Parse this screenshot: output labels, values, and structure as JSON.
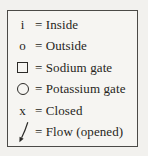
{
  "figure": {
    "type": "legend",
    "background_color": "#f2f1ee",
    "box_background_color": "#f6f5f2",
    "border_color": "#4b4a47",
    "text_color": "#262521"
  },
  "legend": {
    "rows": [
      {
        "symbol": "i",
        "icon": null,
        "label": "= Inside"
      },
      {
        "symbol": "o",
        "icon": null,
        "label": "= Outside"
      },
      {
        "symbol": null,
        "icon": "sodium-gate-square-icon",
        "label": "= Sodium gate"
      },
      {
        "symbol": null,
        "icon": "potassium-gate-circle-icon",
        "label": "= Potassium gate"
      },
      {
        "symbol": "x",
        "icon": null,
        "label": "= Closed"
      },
      {
        "symbol": null,
        "icon": "flow-arrow-icon",
        "label": "= Flow (opened)"
      }
    ]
  }
}
